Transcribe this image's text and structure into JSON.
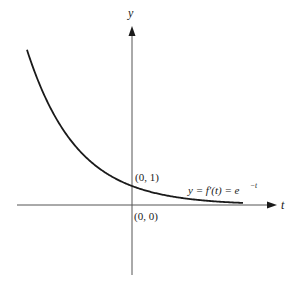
{
  "chart_data": {
    "type": "line",
    "title": "",
    "xlabel": "t",
    "ylabel": "y",
    "series": [
      {
        "name": "y = f'(t) = e^{-t}",
        "function": "e^{-t}",
        "x": [
          -2.1,
          -1.5,
          -1.0,
          -0.5,
          0.0,
          0.5,
          1.0,
          1.5,
          2.0,
          2.22
        ],
        "values": [
          8.17,
          4.48,
          2.72,
          1.65,
          1.0,
          0.61,
          0.37,
          0.22,
          0.14,
          0.11
        ]
      }
    ],
    "annotations": [
      {
        "text": "(0, 1)",
        "x": 0,
        "y": 1
      },
      {
        "text": "(0, 0)",
        "x": 0,
        "y": 0
      }
    ],
    "grid": false,
    "legend": "none",
    "xlim": [
      -2.3,
      2.9
    ],
    "ylim": [
      -1.5,
      8.5
    ]
  },
  "labels": {
    "y_axis": "y",
    "t_axis": "t",
    "point_intercept": "(0, 1)",
    "point_origin": "(0, 0)",
    "equation_lhs": "y = f′(t) = e",
    "equation_exp": "−t"
  },
  "colors": {
    "curve": "#1a1a1a",
    "axis": "#555555",
    "background": "#ffffff"
  }
}
